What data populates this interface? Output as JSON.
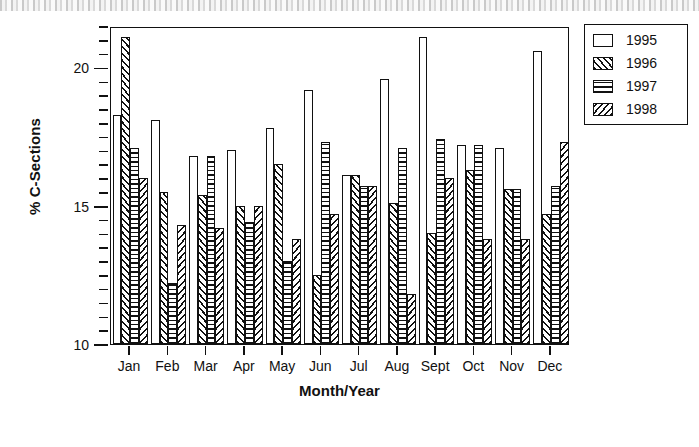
{
  "chart_data": {
    "type": "bar",
    "title": "",
    "xlabel": "Month/Year",
    "ylabel": "% C-Sections",
    "ylim": [
      10,
      21.5
    ],
    "yticks_major": [
      10,
      15,
      20
    ],
    "ytick_step_minor": 0.5,
    "grid": false,
    "legend_position": "right-outside",
    "categories": [
      "Jan",
      "Feb",
      "Mar",
      "Apr",
      "May",
      "Jun",
      "Jul",
      "Aug",
      "Sept",
      "Oct",
      "Nov",
      "Dec"
    ],
    "series": [
      {
        "name": "1995",
        "pattern": "empty",
        "values": [
          18.3,
          18.1,
          16.8,
          17.0,
          17.8,
          19.2,
          16.1,
          19.6,
          21.1,
          17.2,
          17.1,
          20.6
        ]
      },
      {
        "name": "1996",
        "pattern": "diagonal-forward",
        "values": [
          21.1,
          15.5,
          15.4,
          15.0,
          16.5,
          12.5,
          16.1,
          15.1,
          14.0,
          16.3,
          15.6,
          14.7
        ]
      },
      {
        "name": "1997",
        "pattern": "horizontal",
        "values": [
          17.1,
          12.2,
          16.8,
          14.4,
          13.0,
          17.3,
          15.7,
          17.1,
          17.4,
          17.2,
          15.6,
          15.7
        ]
      },
      {
        "name": "1998",
        "pattern": "diagonal-backward",
        "values": [
          16.0,
          14.3,
          14.2,
          15.0,
          13.8,
          14.7,
          15.7,
          11.8,
          16.0,
          13.8,
          13.8,
          17.3
        ]
      }
    ]
  },
  "legend": {
    "items": [
      {
        "label": "1995",
        "pattern": "empty"
      },
      {
        "label": "1996",
        "pattern": "diagonal-forward"
      },
      {
        "label": "1997",
        "pattern": "horizontal"
      },
      {
        "label": "1998",
        "pattern": "diagonal-backward"
      }
    ]
  },
  "axes": {
    "y_title": "% C-Sections",
    "x_title": "Month/Year",
    "y_labels": [
      "20",
      "15",
      "10"
    ]
  },
  "colors": {
    "ink": "#111111",
    "paper": "#ffffff"
  }
}
